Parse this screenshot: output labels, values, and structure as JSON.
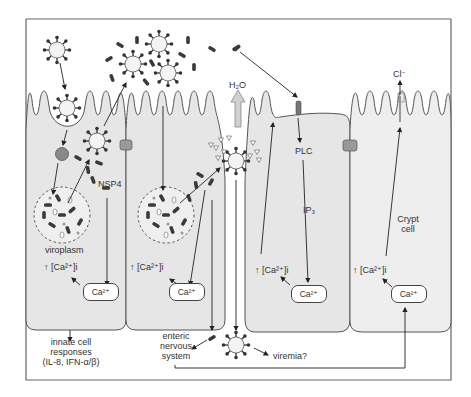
{
  "figure": {
    "colors": {
      "cell_fill": "#e6e6e6",
      "outline": "#555555",
      "virus_fill": "#f4f4f4",
      "particle": "#444444",
      "tight_junction": "#9a9a9a",
      "h2o_arrow": "#d0d0d0",
      "receptor": "#777777"
    }
  },
  "labels": {
    "h2o": "H₂O",
    "chloride": "Cl⁻",
    "nsp4": "NSP4",
    "viroplasm": "viroplasm",
    "plc": "PLC",
    "ip3": "IP₃",
    "crypt_cell_line1": "Crypt",
    "crypt_cell_line2": "cell",
    "ca_increase": "↑ [Ca²⁺]i",
    "ca_store": "Ca²⁺",
    "innate_line1": "innate cell",
    "innate_line2": "responses",
    "innate_line3": "(IL-8, IFN-α/β)",
    "enteric_line1": "enteric",
    "enteric_line2": "nervous",
    "enteric_line3": "system",
    "viremia": "viremia?"
  },
  "cells": [
    {
      "id": "infected-enterocyte-1",
      "ca_label": "↑ [Ca²⁺]i",
      "store": "Ca²⁺"
    },
    {
      "id": "infected-enterocyte-2",
      "ca_label": "↑ [Ca²⁺]i",
      "store": "Ca²⁺"
    },
    {
      "id": "nsp4-responding-enterocyte",
      "ca_label": "↑ [Ca²⁺]i",
      "store": "Ca²⁺"
    },
    {
      "id": "crypt-cell",
      "ca_label": "↑ [Ca²⁺]i",
      "store": "Ca²⁺"
    }
  ]
}
